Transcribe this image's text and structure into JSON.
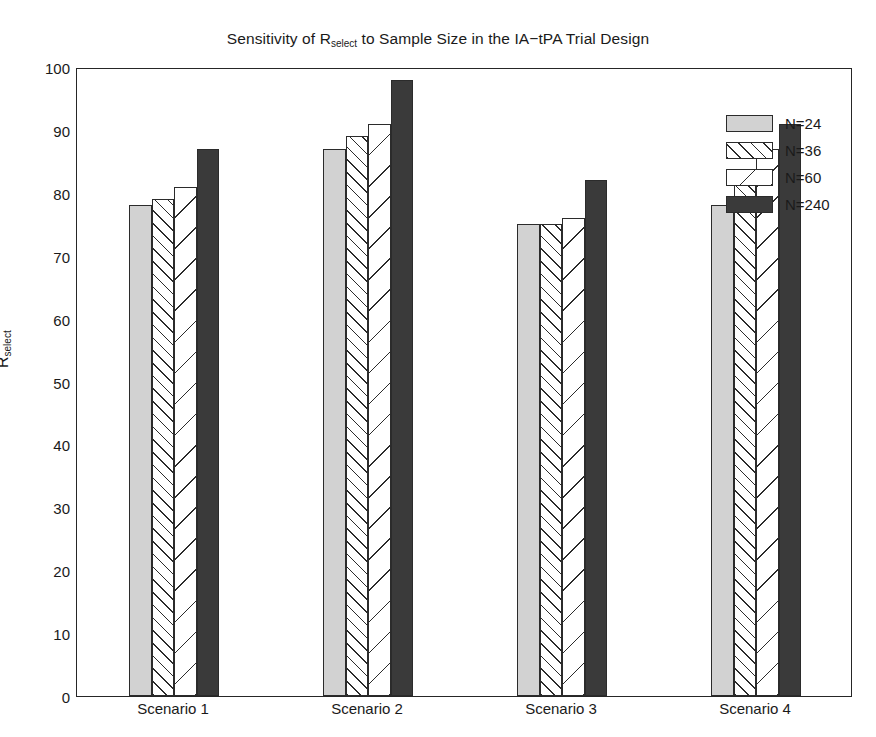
{
  "chart_data": {
    "type": "bar",
    "title_prefix": "Sensitivity of R",
    "title_sub": "select",
    "title_suffix": " to Sample Size in the IA−tPA Trial Design",
    "categories": [
      "Scenario 1",
      "Scenario 2",
      "Scenario 3",
      "Scenario 4"
    ],
    "series": [
      {
        "name": "N=24",
        "values": [
          78,
          87,
          75,
          78
        ],
        "fill": "light-gray-solid",
        "color": "#d2d2d2"
      },
      {
        "name": "N=36",
        "values": [
          79,
          89,
          75,
          82
        ],
        "fill": "dense-hatch-right",
        "color": "#ffffff"
      },
      {
        "name": "N=60",
        "values": [
          81,
          91,
          76,
          87
        ],
        "fill": "sparse-hatch-left",
        "color": "#ffffff"
      },
      {
        "name": "N=240",
        "values": [
          87,
          98,
          82,
          91
        ],
        "fill": "dark-gray-solid",
        "color": "#3a3a3a"
      }
    ],
    "xlabel": "",
    "ylabel": "R_select",
    "ylabel_prefix": "R",
    "ylabel_sub": "select",
    "ylim": [
      0,
      100
    ],
    "yticks": [
      0,
      10,
      20,
      30,
      40,
      50,
      60,
      70,
      80,
      90,
      100
    ],
    "ytick_labels": [
      "0",
      "10",
      "20",
      "30",
      "40",
      "50",
      "60",
      "70",
      "80",
      "90",
      "100"
    ],
    "grid": false,
    "legend_position": "upper right",
    "legend_entries": [
      "N=24",
      "N=36",
      "N=60",
      "N=240"
    ],
    "axis_color": "#262626",
    "background": "#ffffff"
  }
}
